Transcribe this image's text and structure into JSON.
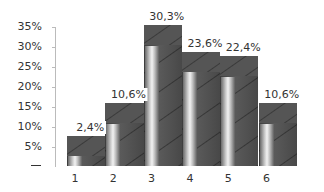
{
  "chart_data": {
    "type": "bar",
    "title": "",
    "xlabel": "",
    "ylabel": "",
    "categories": [
      "1",
      "2",
      "3",
      "4",
      "5",
      "6"
    ],
    "values": [
      2.4,
      10.6,
      30.3,
      23.6,
      22.4,
      10.6
    ],
    "data_labels": [
      "2,4%",
      "10,6%",
      "30,3%",
      "23,6%",
      "22,4%",
      "10,6%"
    ],
    "background_box_values": [
      7.5,
      15.8,
      35.6,
      28.6,
      27.8,
      15.8
    ],
    "ylim": [
      0,
      35
    ],
    "yticks": [
      "35%",
      "30%",
      "25%",
      "20%",
      "15%",
      "10%",
      "5%",
      ""
    ],
    "grid": false,
    "legend": null
  },
  "colors": {
    "box_dark": "#484848",
    "cylinder_light": "#f2f2f2",
    "text": "#333333",
    "axis": "#bbbbbb"
  }
}
